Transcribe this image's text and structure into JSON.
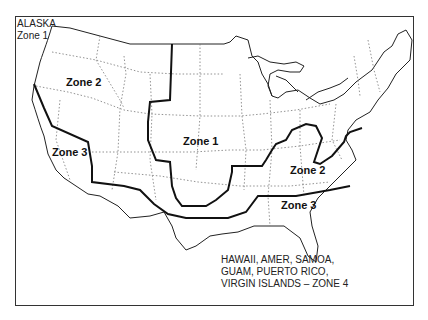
{
  "map": {
    "title": "Climate Zones Map (USA)",
    "corner_label": {
      "line1": "ALASKA",
      "line2": "Zone 1"
    },
    "zones": [
      {
        "label": "Zone 1",
        "x": 183,
        "y": 142
      },
      {
        "label": "Zone 2",
        "x": 66,
        "y": 82
      },
      {
        "label": "Zone 3",
        "x": 52,
        "y": 152
      },
      {
        "label": "Zone 2",
        "x": 290,
        "y": 170
      },
      {
        "label": "Zone 3",
        "x": 281,
        "y": 205
      }
    ],
    "note": {
      "line1": "HAWAII, AMER, SAMOA,",
      "line2": "GUAM, PUERTO RICO,",
      "line3": "VIRGIN ISLANDS – ZONE 4"
    },
    "colors": {
      "line": "#111111",
      "state_border": "#777777",
      "background": "#ffffff"
    }
  }
}
